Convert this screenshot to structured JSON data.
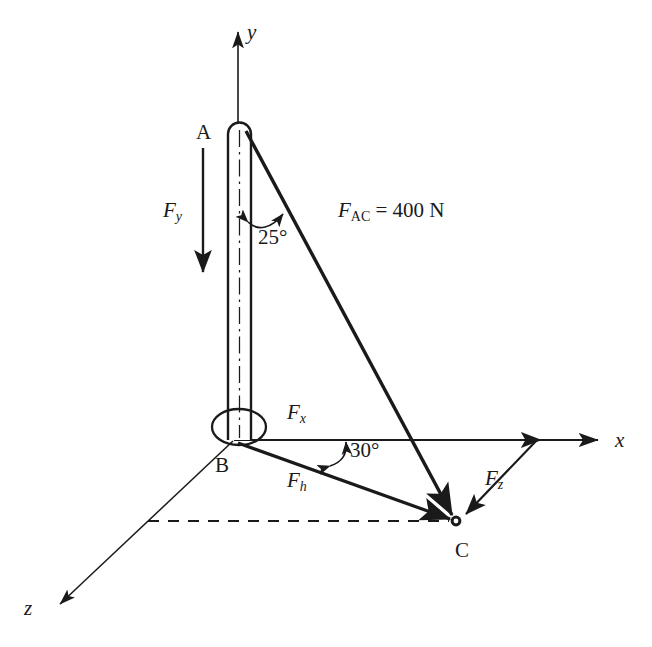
{
  "figure": {
    "background_color": "#ffffff",
    "stroke_color": "#1a1a1a"
  },
  "axes": [
    {
      "id": "y",
      "label": "y",
      "direction": "up",
      "label_x": 247,
      "label_y": 22
    },
    {
      "id": "x",
      "label": "x",
      "direction": "right",
      "label_x": 615,
      "label_y": 430
    },
    {
      "id": "z",
      "label": "z",
      "direction": "down-left",
      "label_x": 24,
      "label_y": 598
    }
  ],
  "points": [
    {
      "id": "A",
      "label": "A",
      "label_x": 196,
      "label_y": 122
    },
    {
      "id": "B",
      "label": "B",
      "label_x": 215,
      "label_y": 455
    },
    {
      "id": "C",
      "label": "C",
      "label_x": 455,
      "label_y": 540
    }
  ],
  "forces": [
    {
      "id": "Fy",
      "base": "F",
      "sub": "y",
      "sub_style": "italic",
      "label_x": 163,
      "label_y": 200
    },
    {
      "id": "Fx",
      "base": "F",
      "sub": "x",
      "sub_style": "italic",
      "label_x": 287,
      "label_y": 402
    },
    {
      "id": "Fh",
      "base": "F",
      "sub": "h",
      "sub_style": "italic",
      "label_x": 287,
      "label_y": 470
    },
    {
      "id": "Fz",
      "base": "F",
      "sub": "z",
      "sub_style": "italic",
      "label_x": 485,
      "label_y": 468
    },
    {
      "id": "FAC",
      "base": "F",
      "sub": "AC",
      "sub_style": "upright",
      "value": " = 400 N",
      "label_x": 338,
      "label_y": 200
    }
  ],
  "angles": [
    {
      "id": "angle-25",
      "label": "25°",
      "between": "pole-AB and cable-AC",
      "label_x": 258,
      "label_y": 227
    },
    {
      "id": "angle-30",
      "label": "30°",
      "between": "x-axis and Fh",
      "label_x": 350,
      "label_y": 440
    }
  ],
  "annotations": {
    "cable_force_text": "F_AC = 400 N",
    "centerline_style": "dash-dot",
    "projection_line_style": "dashed"
  }
}
